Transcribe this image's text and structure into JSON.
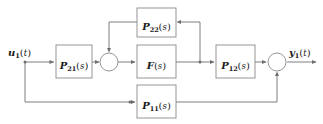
{
  "diagram": {
    "type": "control-system-block-diagram",
    "width": 323,
    "height": 124,
    "background_color": "#ffffff",
    "line_color": "#6f6f6f",
    "box_stroke_color": "#8a8a8a",
    "text_color": "#1a1a1a"
  },
  "signals": {
    "input": {
      "name": "u",
      "subscript": "1",
      "open_paren": "(",
      "arg": "t",
      "close_paren": ")"
    },
    "output": {
      "name": "y",
      "subscript": "1",
      "open_paren": "(",
      "arg": "t",
      "close_paren": ")"
    }
  },
  "blocks": [
    {
      "id": "p21",
      "name": "P",
      "subscript": "21",
      "open_paren": "(",
      "arg": "s",
      "close_paren": ")",
      "role": "input-path"
    },
    {
      "id": "f",
      "name": "F",
      "subscript": "",
      "open_paren": "(",
      "arg": "s",
      "close_paren": ")",
      "role": "controller"
    },
    {
      "id": "p22",
      "name": "P",
      "subscript": "22",
      "open_paren": "(",
      "arg": "s",
      "close_paren": ")",
      "role": "inner-feedback"
    },
    {
      "id": "p12",
      "name": "P",
      "subscript": "12",
      "open_paren": "(",
      "arg": "s",
      "close_paren": ")",
      "role": "output-path"
    },
    {
      "id": "p11",
      "name": "P",
      "subscript": "11",
      "open_paren": "(",
      "arg": "s",
      "close_paren": ")",
      "role": "feedforward-bypass"
    }
  ],
  "junctions": [
    {
      "id": "sum-inner",
      "label": "",
      "type": "summing-node"
    },
    {
      "id": "sum-output",
      "label": "",
      "type": "summing-node"
    }
  ]
}
